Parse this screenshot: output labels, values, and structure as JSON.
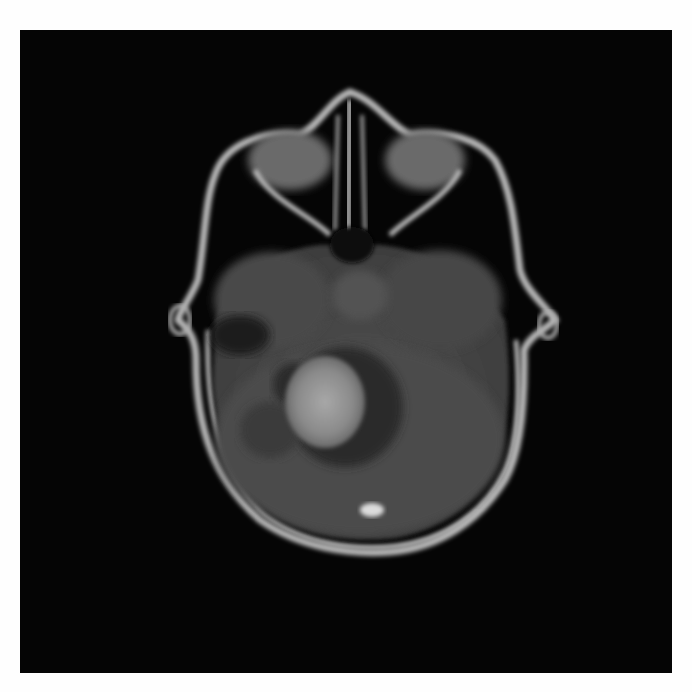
{
  "image": {
    "description": "Axial T1 contrast-enhanced brain MRI showing a posterior fossa (cerebellar) mass with enhancing center and surrounding dark cystic/edema region",
    "colors": {
      "page_background": "#fefefe",
      "panel_background": "#050505",
      "skull_outline": "#c8c8c8",
      "brain_tissue": "#4a4a4a",
      "lesion_bright": "#9a9a9a",
      "lesion_dark": "#2a2a2a"
    }
  }
}
